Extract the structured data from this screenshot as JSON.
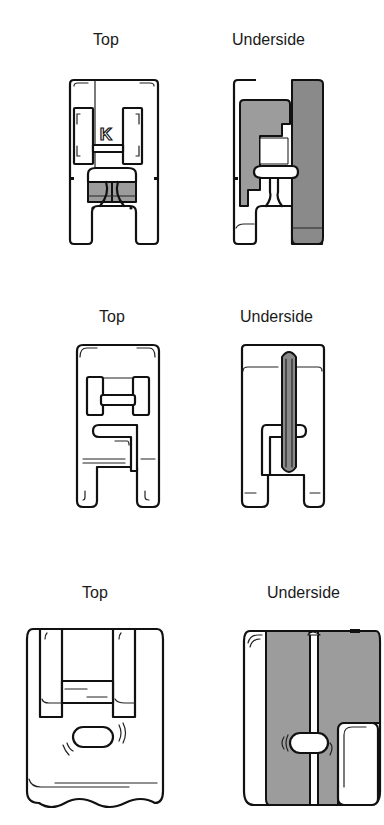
{
  "figure": {
    "rows": [
      {
        "id": "foot-k",
        "top_label": "Top",
        "underside_label": "Underside",
        "top_marking": "K"
      },
      {
        "id": "foot-2",
        "top_label": "Top",
        "underside_label": "Underside"
      },
      {
        "id": "foot-3",
        "top_label": "Top",
        "underside_label": "Underside"
      }
    ],
    "colors": {
      "line": "#111111",
      "shading": "#9c9c9c",
      "background": "#ffffff"
    }
  }
}
